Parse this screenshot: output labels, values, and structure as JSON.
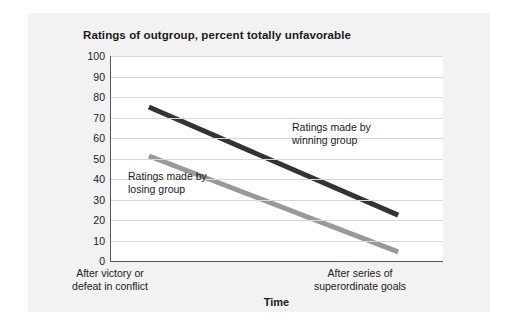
{
  "chart_data": {
    "type": "line",
    "title": "Ratings of outgroup, percent totally unfavorable",
    "xlabel": "Time",
    "ylabel": "",
    "ylim": [
      0,
      100
    ],
    "yticks": [
      0,
      10,
      20,
      30,
      40,
      50,
      60,
      70,
      80,
      90,
      100
    ],
    "grid": true,
    "legend_position": "inline-annotations",
    "x": [
      "After victory or defeat in conflict",
      "After series of superordinate goals"
    ],
    "xtick_labels": [
      {
        "line1": "After victory or",
        "line2": "defeat in conflict"
      },
      {
        "line1": "After series of",
        "line2": "superordinate goals"
      }
    ],
    "series": [
      {
        "name": "Ratings made by winning group",
        "values": [
          75,
          22
        ],
        "color": "#333333",
        "width": 5,
        "annotation": {
          "line1": "Ratings made by",
          "line2": "winning group"
        }
      },
      {
        "name": "Ratings made by losing group",
        "values": [
          51,
          4
        ],
        "color": "#999999",
        "width": 5,
        "annotation": {
          "line1": "Ratings made by",
          "line2": "losing group"
        }
      }
    ],
    "colors": {
      "card_background": "#f2f2f2",
      "plot_background": "#ffffff",
      "axis": "#555555",
      "gridline": "#d8d8d8",
      "text": "#1a1a1a"
    }
  }
}
